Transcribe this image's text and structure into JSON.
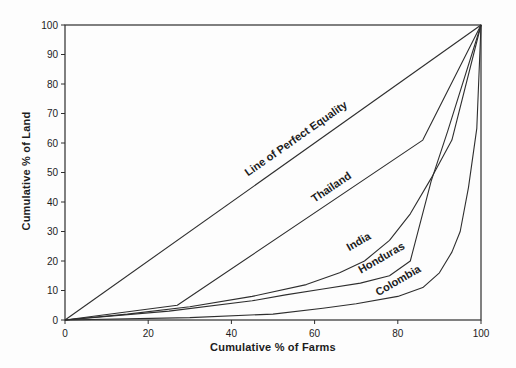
{
  "figure": {
    "background": "#fdfdfd",
    "line_color": "#2e2e2e",
    "text_color": "#1c1c1c"
  },
  "chart_data": {
    "type": "line",
    "title": "",
    "xlabel": "Cumulative % of Farms",
    "ylabel": "Cumulative % of Land",
    "xlim": [
      0,
      100
    ],
    "ylim": [
      0,
      100
    ],
    "x_ticks": [
      0,
      20,
      40,
      60,
      80,
      100
    ],
    "y_ticks": [
      0,
      10,
      20,
      30,
      40,
      50,
      60,
      70,
      80,
      90,
      100
    ],
    "grid": false,
    "legend": "inline-rotated-labels",
    "series": [
      {
        "name": "Line of Perfect Equality",
        "points": [
          [
            0,
            0
          ],
          [
            100,
            100
          ]
        ],
        "label": {
          "x": 56,
          "y": 60.5,
          "angle": -35
        }
      },
      {
        "name": "Thailand",
        "points": [
          [
            0,
            0
          ],
          [
            27,
            5
          ],
          [
            86,
            61
          ],
          [
            100,
            100
          ]
        ],
        "label": {
          "x": 64.5,
          "y": 44,
          "angle": -34
        }
      },
      {
        "name": "India",
        "points": [
          [
            0,
            0
          ],
          [
            15,
            2
          ],
          [
            30,
            4.5
          ],
          [
            45,
            8
          ],
          [
            58,
            12
          ],
          [
            66,
            16
          ],
          [
            72,
            20
          ],
          [
            78,
            27
          ],
          [
            83,
            36
          ],
          [
            88,
            48
          ],
          [
            93,
            61
          ],
          [
            100,
            100
          ]
        ],
        "label": {
          "x": 71,
          "y": 25.5,
          "angle": -30
        }
      },
      {
        "name": "Honduras",
        "points": [
          [
            0,
            0
          ],
          [
            25,
            3
          ],
          [
            45,
            6.5
          ],
          [
            53,
            8.5
          ],
          [
            62,
            10.5
          ],
          [
            71,
            12.5
          ],
          [
            78,
            15
          ],
          [
            83,
            20
          ],
          [
            88,
            47
          ],
          [
            92,
            64
          ],
          [
            100,
            100
          ]
        ],
        "label": {
          "x": 76.5,
          "y": 20,
          "angle": -30
        }
      },
      {
        "name": "Colombia",
        "points": [
          [
            0,
            0
          ],
          [
            30,
            0.8
          ],
          [
            50,
            2
          ],
          [
            62,
            4
          ],
          [
            70,
            5.5
          ],
          [
            80,
            8
          ],
          [
            86,
            11
          ],
          [
            90,
            16
          ],
          [
            93,
            23
          ],
          [
            95,
            30
          ],
          [
            97,
            45
          ],
          [
            99,
            65
          ],
          [
            100,
            100
          ]
        ],
        "label": {
          "x": 80.5,
          "y": 12.3,
          "angle": -30
        }
      }
    ]
  }
}
